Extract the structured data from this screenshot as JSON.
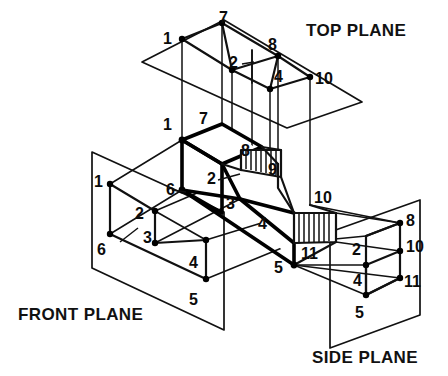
{
  "figure": {
    "background_color": "#ffffff",
    "line_color": "#111111",
    "planes": [
      {
        "id": "top",
        "label": "TOP PLANE",
        "label_x": 306,
        "label_y": 36
      },
      {
        "id": "front",
        "label": "FRONT PLANE",
        "label_x": 18,
        "label_y": 320
      },
      {
        "id": "side",
        "label": "SIDE PLANE",
        "label_x": 312,
        "label_y": 363
      }
    ],
    "vertex_labels": {
      "top_plane": [
        {
          "text": "7",
          "x": 226,
          "y": 21
        },
        {
          "text": "1",
          "x": 168,
          "y": 43
        },
        {
          "text": "8",
          "x": 272,
          "y": 48
        },
        {
          "text": "2",
          "x": 234,
          "y": 63
        },
        {
          "text": "4",
          "x": 279,
          "y": 82
        },
        {
          "text": "10",
          "x": 319,
          "y": 85
        }
      ],
      "object": [
        {
          "text": "1",
          "x": 167,
          "y": 123
        },
        {
          "text": "7",
          "x": 202,
          "y": 118
        },
        {
          "text": "8",
          "x": 245,
          "y": 152
        },
        {
          "text": "9",
          "x": 270,
          "y": 170
        },
        {
          "text": "2",
          "x": 211,
          "y": 179
        },
        {
          "text": "6",
          "x": 170,
          "y": 190
        },
        {
          "text": "3",
          "x": 229,
          "y": 204
        },
        {
          "text": "4",
          "x": 261,
          "y": 224
        },
        {
          "text": "10",
          "x": 318,
          "y": 199
        },
        {
          "text": "11",
          "x": 305,
          "y": 254
        },
        {
          "text": "5",
          "x": 277,
          "y": 267
        }
      ],
      "front_plane": [
        {
          "text": "1",
          "x": 97,
          "y": 181
        },
        {
          "text": "2",
          "x": 139,
          "y": 214
        },
        {
          "text": "3",
          "x": 147,
          "y": 237
        },
        {
          "text": "6",
          "x": 100,
          "y": 249
        },
        {
          "text": "4",
          "x": 193,
          "y": 263
        },
        {
          "text": "5",
          "x": 192,
          "y": 300
        }
      ],
      "side_plane": [
        {
          "text": "8",
          "x": 410,
          "y": 220
        },
        {
          "text": "2",
          "x": 355,
          "y": 250
        },
        {
          "text": "10",
          "x": 410,
          "y": 247
        },
        {
          "text": "4",
          "x": 356,
          "y": 281
        },
        {
          "text": "11",
          "x": 408,
          "y": 282
        },
        {
          "text": "5",
          "x": 358,
          "y": 313
        }
      ]
    },
    "hatched_faces": [
      {
        "id": "upper-hatched-face",
        "vertices": "241,170 241,150 281,150 281,177"
      },
      {
        "id": "lower-hatched-face",
        "vertices": "294,243 294,213 336,213 336,242"
      }
    ]
  }
}
